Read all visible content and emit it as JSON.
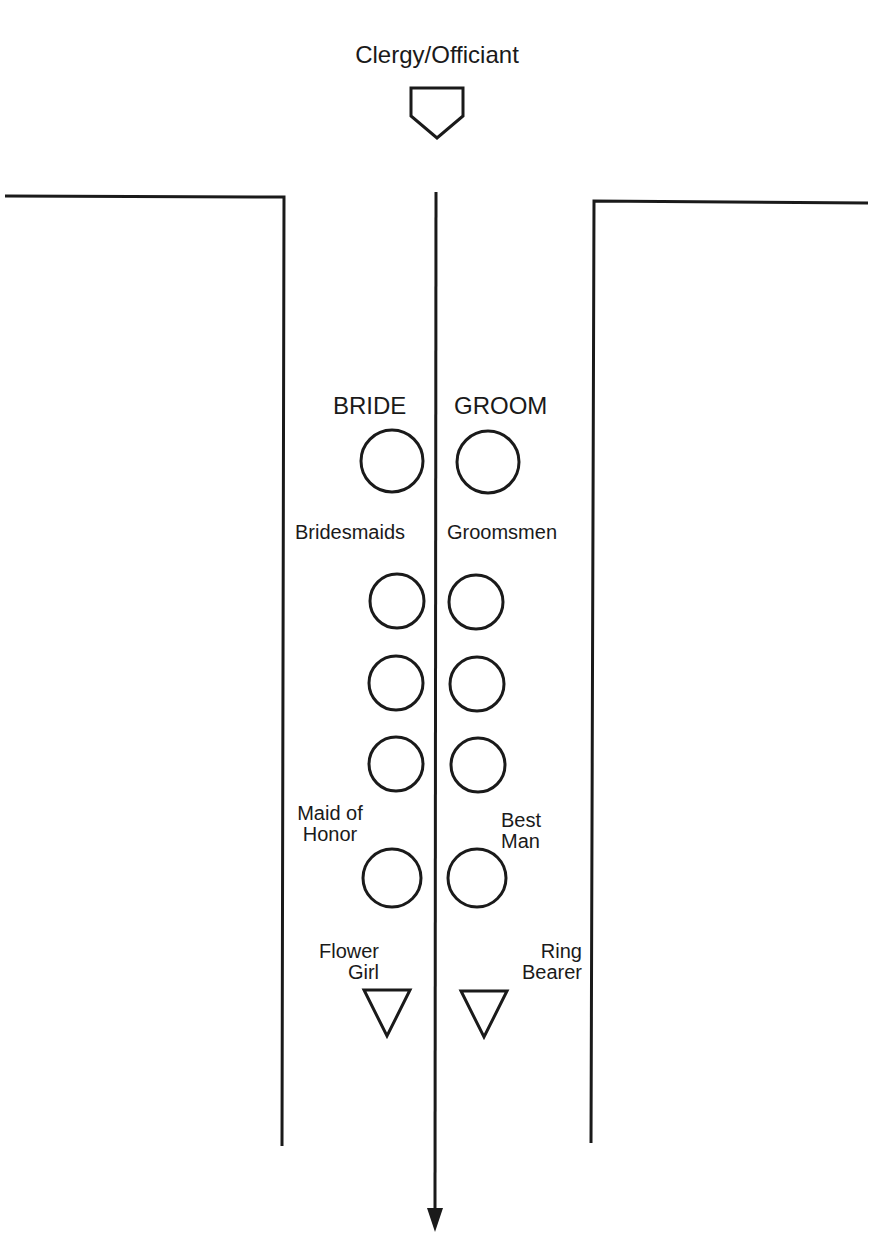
{
  "diagram": {
    "title": "Clergy/Officiant",
    "labels": {
      "bride": "BRIDE",
      "groom": "GROOM",
      "bridesmaids": "Bridesmaids",
      "groomsmen": "Groomsmen",
      "maid_of_honor_line1": "Maid of",
      "maid_of_honor_line2": "Honor",
      "best_man_line1": "Best",
      "best_man_line2": "Man",
      "flower_girl_line1": "Flower",
      "flower_girl_line2": "Girl",
      "ring_bearer_line1": "Ring",
      "ring_bearer_line2": "Bearer"
    },
    "shapes": {
      "officiant": "pentagon-pointing-down",
      "people": "circle",
      "children": "triangle-pointing-down",
      "aisle_arrow": "arrow-down"
    },
    "bridesmaids_count": 3,
    "groomsmen_count": 3
  }
}
